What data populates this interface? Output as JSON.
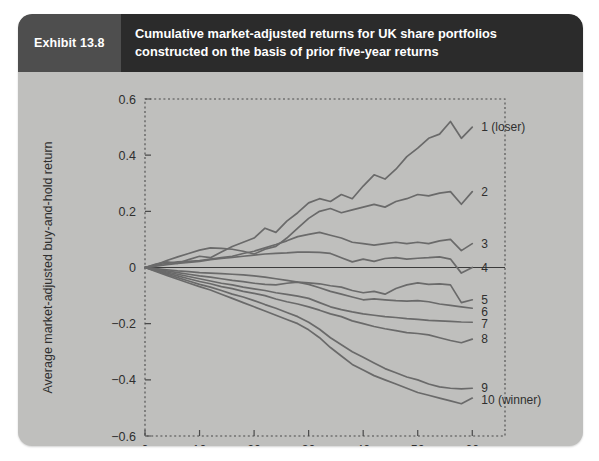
{
  "exhibit": {
    "number_label": "Exhibit 13.8",
    "title": "Cumulative market-adjusted returns for UK share portfolios constructed on the basis of prior five-year returns"
  },
  "chart_data": {
    "type": "line",
    "title": "Cumulative market-adjusted returns for UK share portfolios constructed on the basis of prior five-year returns",
    "xlabel": "Months since portfolio formation",
    "ylabel": "Average market-adjusted buy-and-hold return",
    "xlim": [
      0,
      66
    ],
    "ylim": [
      -0.6,
      0.6
    ],
    "xticks": [
      0,
      10,
      20,
      30,
      40,
      50,
      60
    ],
    "xtick_labels": [
      "0",
      "10",
      "20",
      "30",
      "40",
      "50",
      "60"
    ],
    "yticks": [
      -0.6,
      -0.4,
      -0.2,
      0,
      0.2,
      0.4,
      0.6
    ],
    "ytick_labels": [
      "−0.6",
      "−0.4",
      "−0.2",
      "0",
      "0.2",
      "0.4",
      "0.6"
    ],
    "grid": false,
    "zero_line": true,
    "legend_position": "right-inline-labels",
    "x": [
      0,
      2,
      4,
      6,
      8,
      10,
      12,
      14,
      16,
      18,
      20,
      22,
      24,
      26,
      28,
      30,
      32,
      34,
      36,
      38,
      40,
      42,
      44,
      46,
      48,
      50,
      52,
      54,
      56,
      58,
      60
    ],
    "series": [
      {
        "name": "1 (loser)",
        "label": "1 (loser)",
        "end_value": 0.5,
        "values": [
          0,
          0.012,
          0.02,
          0.015,
          0.028,
          0.04,
          0.035,
          0.055,
          0.075,
          0.09,
          0.105,
          0.14,
          0.125,
          0.165,
          0.195,
          0.23,
          0.245,
          0.235,
          0.26,
          0.245,
          0.29,
          0.33,
          0.315,
          0.35,
          0.395,
          0.425,
          0.46,
          0.475,
          0.52,
          0.46,
          0.5
        ]
      },
      {
        "name": "2",
        "label": "2",
        "end_value": 0.27,
        "values": [
          0,
          0.01,
          0.025,
          0.038,
          0.05,
          0.062,
          0.07,
          0.068,
          0.065,
          0.058,
          0.048,
          0.065,
          0.075,
          0.105,
          0.14,
          0.175,
          0.2,
          0.21,
          0.195,
          0.205,
          0.215,
          0.225,
          0.215,
          0.235,
          0.245,
          0.26,
          0.255,
          0.265,
          0.27,
          0.225,
          0.27
        ]
      },
      {
        "name": "3",
        "label": "3",
        "end_value": 0.085,
        "values": [
          0,
          0.008,
          0.015,
          0.02,
          0.022,
          0.025,
          0.03,
          0.035,
          0.04,
          0.05,
          0.058,
          0.07,
          0.082,
          0.095,
          0.11,
          0.118,
          0.125,
          0.115,
          0.105,
          0.09,
          0.085,
          0.08,
          0.085,
          0.09,
          0.085,
          0.09,
          0.085,
          0.095,
          0.1,
          0.06,
          0.085
        ]
      },
      {
        "name": "4",
        "label": "4",
        "end_value": 0.0,
        "values": [
          0,
          0.005,
          0.01,
          0.015,
          0.018,
          0.022,
          0.028,
          0.032,
          0.036,
          0.04,
          0.044,
          0.048,
          0.05,
          0.052,
          0.055,
          0.055,
          0.054,
          0.05,
          0.035,
          0.02,
          0.03,
          0.022,
          0.032,
          0.035,
          0.03,
          0.033,
          0.035,
          0.038,
          0.03,
          -0.02,
          0.0
        ]
      },
      {
        "name": "5",
        "label": "5",
        "end_value": -0.115,
        "values": [
          0,
          -0.004,
          -0.008,
          -0.012,
          -0.015,
          -0.018,
          -0.02,
          -0.022,
          -0.024,
          -0.026,
          -0.03,
          -0.034,
          -0.04,
          -0.046,
          -0.052,
          -0.055,
          -0.058,
          -0.065,
          -0.07,
          -0.082,
          -0.09,
          -0.085,
          -0.095,
          -0.075,
          -0.062,
          -0.055,
          -0.06,
          -0.058,
          -0.062,
          -0.125,
          -0.115
        ]
      },
      {
        "name": "6",
        "label": "6",
        "end_value": -0.145,
        "values": [
          0,
          -0.006,
          -0.012,
          -0.018,
          -0.024,
          -0.03,
          -0.034,
          -0.04,
          -0.046,
          -0.05,
          -0.056,
          -0.06,
          -0.062,
          -0.056,
          -0.052,
          -0.06,
          -0.072,
          -0.085,
          -0.095,
          -0.105,
          -0.115,
          -0.112,
          -0.115,
          -0.118,
          -0.12,
          -0.118,
          -0.122,
          -0.13,
          -0.135,
          -0.14,
          -0.145
        ]
      },
      {
        "name": "7",
        "label": "7",
        "end_value": -0.195,
        "values": [
          0,
          -0.008,
          -0.016,
          -0.024,
          -0.032,
          -0.04,
          -0.048,
          -0.056,
          -0.062,
          -0.07,
          -0.076,
          -0.082,
          -0.09,
          -0.096,
          -0.102,
          -0.11,
          -0.125,
          -0.14,
          -0.15,
          -0.158,
          -0.165,
          -0.17,
          -0.175,
          -0.178,
          -0.182,
          -0.185,
          -0.188,
          -0.19,
          -0.192,
          -0.194,
          -0.195
        ]
      },
      {
        "name": "8",
        "label": "8",
        "end_value": -0.255,
        "values": [
          0,
          -0.01,
          -0.02,
          -0.03,
          -0.04,
          -0.05,
          -0.058,
          -0.068,
          -0.075,
          -0.085,
          -0.092,
          -0.1,
          -0.112,
          -0.122,
          -0.13,
          -0.14,
          -0.152,
          -0.165,
          -0.175,
          -0.19,
          -0.2,
          -0.21,
          -0.218,
          -0.225,
          -0.232,
          -0.235,
          -0.24,
          -0.25,
          -0.26,
          -0.268,
          -0.255
        ]
      },
      {
        "name": "9",
        "label": "9",
        "end_value": -0.43,
        "values": [
          0,
          -0.012,
          -0.024,
          -0.036,
          -0.048,
          -0.06,
          -0.07,
          -0.082,
          -0.095,
          -0.105,
          -0.118,
          -0.132,
          -0.145,
          -0.16,
          -0.175,
          -0.195,
          -0.22,
          -0.25,
          -0.275,
          -0.3,
          -0.32,
          -0.34,
          -0.36,
          -0.375,
          -0.39,
          -0.4,
          -0.415,
          -0.425,
          -0.43,
          -0.432,
          -0.43
        ]
      },
      {
        "name": "10 (winner)",
        "label": "10 (winner)",
        "end_value": -0.465,
        "values": [
          0,
          -0.014,
          -0.028,
          -0.042,
          -0.055,
          -0.068,
          -0.08,
          -0.095,
          -0.11,
          -0.125,
          -0.14,
          -0.155,
          -0.17,
          -0.185,
          -0.2,
          -0.222,
          -0.25,
          -0.285,
          -0.315,
          -0.345,
          -0.365,
          -0.385,
          -0.4,
          -0.415,
          -0.43,
          -0.445,
          -0.455,
          -0.465,
          -0.475,
          -0.485,
          -0.465
        ]
      }
    ]
  },
  "colors": {
    "card_background": "#bfbfbd",
    "header_number_bg": "#4e4e4e",
    "header_title_bg": "#2b2b2b",
    "line_color": "#6a6a6a",
    "axis_color": "#4a4a4a",
    "text_color": "#2f2f2f"
  }
}
